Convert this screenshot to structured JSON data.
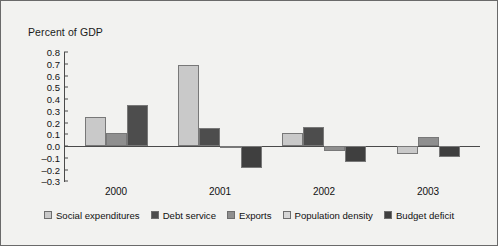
{
  "axis_title": "Percent of GDP",
  "colors": {
    "social_expenditures": "#c9c9c9",
    "debt_service": "#4d4d4d",
    "exports": "#8f8f8f",
    "population_density": "#d6d6d6",
    "budget_deficit": "#3f3f3f",
    "background": "#f2f2f0",
    "axis": "#4a4a4a",
    "text": "#111111"
  },
  "legend": {
    "items": [
      {
        "label": "Social expenditures",
        "color": "#c9c9c9"
      },
      {
        "label": "Debt service",
        "color": "#4d4d4d"
      },
      {
        "label": "Exports",
        "color": "#8f8f8f"
      },
      {
        "label": "Population density",
        "color": "#d6d6d6"
      },
      {
        "label": "Budget deficit",
        "color": "#3f3f3f"
      }
    ]
  },
  "chart_data": {
    "type": "bar",
    "title": "",
    "xlabel": "",
    "ylabel": "Percent of GDP",
    "ylim": [
      -0.3,
      0.8
    ],
    "ytick_labels": [
      "0.8",
      "0.7",
      "0.6",
      "0.5",
      "0.4",
      "0.3",
      "0.2",
      "0.1",
      "0.0",
      "–0.1",
      "–0.2",
      "–0.3"
    ],
    "ytick_values": [
      0.8,
      0.7,
      0.6,
      0.5,
      0.4,
      0.3,
      0.2,
      0.1,
      0.0,
      -0.1,
      -0.2,
      -0.3
    ],
    "grid": false,
    "legend_position": "bottom",
    "categories": [
      "2000",
      "2001",
      "2002",
      "2003"
    ],
    "series": [
      {
        "name": "Social expenditures",
        "color": "#c9c9c9",
        "values": [
          0.25,
          0.69,
          0.11,
          0.0
        ]
      },
      {
        "name": "Debt service",
        "color": "#4d4d4d",
        "values": [
          0.11,
          0.155,
          0.16,
          0.0
        ]
      },
      {
        "name": "Exports",
        "color": "#8f8f8f",
        "values": [
          0.0,
          0.0,
          0.0,
          -0.07
        ]
      },
      {
        "name": "Population density",
        "color": "#d6d6d6",
        "values": [
          0.345,
          -0.015,
          -0.04,
          0.08
        ]
      },
      {
        "name": "Budget deficit",
        "color": "#3f3f3f",
        "values": [
          0.0,
          -0.185,
          -0.14,
          -0.09
        ]
      }
    ],
    "bars": [
      {
        "group": "2000",
        "series": "Social expenditures",
        "value": 0.25,
        "color": "#c9c9c9"
      },
      {
        "group": "2000",
        "series": "Debt service",
        "value": 0.11,
        "color": "#8f8f8f"
      },
      {
        "group": "2000",
        "series": "Population density",
        "value": 0.345,
        "color": "#4d4d4d"
      },
      {
        "group": "2001",
        "series": "Social expenditures",
        "value": 0.69,
        "color": "#c9c9c9"
      },
      {
        "group": "2001",
        "series": "Debt service",
        "value": 0.155,
        "color": "#4d4d4d"
      },
      {
        "group": "2001",
        "series": "Exports",
        "value": -0.015,
        "color": "#8f8f8f"
      },
      {
        "group": "2001",
        "series": "Budget deficit",
        "value": -0.185,
        "color": "#3f3f3f"
      },
      {
        "group": "2002",
        "series": "Social expenditures",
        "value": 0.11,
        "color": "#c9c9c9"
      },
      {
        "group": "2002",
        "series": "Debt service",
        "value": 0.16,
        "color": "#4d4d4d"
      },
      {
        "group": "2002",
        "series": "Exports",
        "value": -0.04,
        "color": "#8f8f8f"
      },
      {
        "group": "2002",
        "series": "Budget deficit",
        "value": -0.14,
        "color": "#3f3f3f"
      },
      {
        "group": "2003",
        "series": "Exports",
        "value": -0.07,
        "color": "#c9c9c9"
      },
      {
        "group": "2003",
        "series": "Population density",
        "value": 0.08,
        "color": "#8f8f8f"
      },
      {
        "group": "2003",
        "series": "Budget deficit",
        "value": -0.09,
        "color": "#3f3f3f"
      }
    ]
  },
  "year_labels": [
    "2000",
    "2001",
    "2002",
    "2003"
  ]
}
